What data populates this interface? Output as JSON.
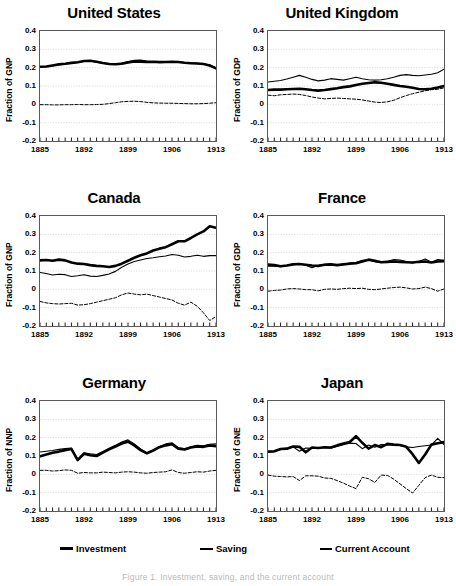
{
  "figure": {
    "caption": "Figure 1. Investment, saving, and the current account",
    "x_start": 1885,
    "x_end": 1913,
    "ylim": [
      -0.2,
      0.4
    ],
    "yticks": [
      "0.4",
      "0.3",
      "0.2",
      "0.1",
      "0",
      "-0.1",
      "-0.2"
    ],
    "xticklabels": [
      "1885",
      "1892",
      "1899",
      "1906",
      "1913"
    ],
    "xtickyears": [
      1885,
      1892,
      1899,
      1906,
      1913
    ]
  },
  "legend": {
    "items": [
      {
        "label": "Investment",
        "style": "thick-solid",
        "color": "#000000"
      },
      {
        "label": "Saving",
        "style": "thin-solid",
        "color": "#000000"
      },
      {
        "label": "Current Account",
        "style": "dashed",
        "color": "#000000"
      }
    ]
  },
  "chart_data": [
    {
      "type": "line",
      "title": "United States",
      "xlabel": "",
      "ylabel": "Fraction of GNP",
      "x": [
        1885,
        1886,
        1887,
        1888,
        1889,
        1890,
        1891,
        1892,
        1893,
        1894,
        1895,
        1896,
        1897,
        1898,
        1899,
        1900,
        1901,
        1902,
        1903,
        1904,
        1905,
        1906,
        1907,
        1908,
        1909,
        1910,
        1911,
        1912,
        1913
      ],
      "ylim": [
        -0.2,
        0.4
      ],
      "grid": true,
      "series": [
        {
          "name": "Investment",
          "values": [
            0.205,
            0.206,
            0.212,
            0.218,
            0.221,
            0.226,
            0.23,
            0.236,
            0.238,
            0.232,
            0.225,
            0.22,
            0.219,
            0.221,
            0.228,
            0.234,
            0.233,
            0.231,
            0.232,
            0.23,
            0.231,
            0.232,
            0.231,
            0.227,
            0.224,
            0.223,
            0.22,
            0.212,
            0.196
          ]
        },
        {
          "name": "Saving",
          "values": [
            0.204,
            0.205,
            0.21,
            0.216,
            0.22,
            0.224,
            0.229,
            0.234,
            0.236,
            0.23,
            0.224,
            0.219,
            0.22,
            0.225,
            0.234,
            0.24,
            0.241,
            0.236,
            0.232,
            0.23,
            0.23,
            0.231,
            0.231,
            0.228,
            0.226,
            0.224,
            0.221,
            0.214,
            0.199
          ]
        },
        {
          "name": "Current Account",
          "values": [
            -0.002,
            -0.002,
            -0.003,
            -0.003,
            -0.002,
            -0.002,
            -0.001,
            -0.002,
            -0.002,
            -0.001,
            0.0,
            0.004,
            0.009,
            0.014,
            0.016,
            0.017,
            0.015,
            0.011,
            0.008,
            0.007,
            0.006,
            0.006,
            0.005,
            0.004,
            0.003,
            0.003,
            0.004,
            0.006,
            0.009
          ]
        }
      ]
    },
    {
      "type": "line",
      "title": "United Kingdom",
      "xlabel": "",
      "ylabel": "Fraction of GDP",
      "x": [
        1885,
        1886,
        1887,
        1888,
        1889,
        1890,
        1891,
        1892,
        1893,
        1894,
        1895,
        1896,
        1897,
        1898,
        1899,
        1900,
        1901,
        1902,
        1903,
        1904,
        1905,
        1906,
        1907,
        1908,
        1909,
        1910,
        1911,
        1912,
        1913
      ],
      "ylim": [
        -0.2,
        0.4
      ],
      "grid": true,
      "series": [
        {
          "name": "Investment",
          "values": [
            0.078,
            0.08,
            0.08,
            0.082,
            0.084,
            0.085,
            0.082,
            0.078,
            0.075,
            0.078,
            0.083,
            0.088,
            0.094,
            0.098,
            0.105,
            0.112,
            0.116,
            0.12,
            0.118,
            0.112,
            0.106,
            0.1,
            0.096,
            0.09,
            0.084,
            0.082,
            0.085,
            0.092,
            0.1
          ]
        },
        {
          "name": "Saving",
          "values": [
            0.122,
            0.126,
            0.13,
            0.138,
            0.148,
            0.158,
            0.148,
            0.136,
            0.128,
            0.132,
            0.14,
            0.136,
            0.132,
            0.14,
            0.148,
            0.14,
            0.134,
            0.132,
            0.134,
            0.14,
            0.148,
            0.158,
            0.162,
            0.158,
            0.156,
            0.16,
            0.164,
            0.172,
            0.192
          ]
        },
        {
          "name": "Current Account",
          "values": [
            0.05,
            0.047,
            0.052,
            0.054,
            0.056,
            0.054,
            0.048,
            0.04,
            0.034,
            0.03,
            0.032,
            0.034,
            0.032,
            0.03,
            0.028,
            0.024,
            0.018,
            0.012,
            0.01,
            0.014,
            0.022,
            0.036,
            0.048,
            0.058,
            0.066,
            0.074,
            0.08,
            0.082,
            0.09
          ]
        }
      ]
    },
    {
      "type": "line",
      "title": "Canada",
      "xlabel": "",
      "ylabel": "Fraction of GNP",
      "x": [
        1885,
        1886,
        1887,
        1888,
        1889,
        1890,
        1891,
        1892,
        1893,
        1894,
        1895,
        1896,
        1897,
        1898,
        1899,
        1900,
        1901,
        1902,
        1903,
        1904,
        1905,
        1906,
        1907,
        1908,
        1909,
        1910,
        1911,
        1912,
        1913
      ],
      "ylim": [
        -0.2,
        0.4
      ],
      "grid": true,
      "series": [
        {
          "name": "Investment",
          "values": [
            0.158,
            0.16,
            0.156,
            0.162,
            0.158,
            0.146,
            0.14,
            0.138,
            0.132,
            0.128,
            0.126,
            0.122,
            0.128,
            0.14,
            0.156,
            0.172,
            0.186,
            0.196,
            0.212,
            0.222,
            0.23,
            0.246,
            0.262,
            0.262,
            0.28,
            0.3,
            0.316,
            0.344,
            0.336
          ]
        },
        {
          "name": "Saving",
          "values": [
            0.092,
            0.086,
            0.078,
            0.082,
            0.08,
            0.07,
            0.074,
            0.08,
            0.072,
            0.07,
            0.076,
            0.084,
            0.098,
            0.12,
            0.138,
            0.152,
            0.16,
            0.168,
            0.172,
            0.178,
            0.182,
            0.19,
            0.186,
            0.176,
            0.18,
            0.186,
            0.18,
            0.184,
            0.184
          ]
        },
        {
          "name": "Current Account",
          "values": [
            -0.066,
            -0.074,
            -0.078,
            -0.08,
            -0.078,
            -0.076,
            -0.086,
            -0.084,
            -0.078,
            -0.07,
            -0.062,
            -0.054,
            -0.046,
            -0.03,
            -0.02,
            -0.026,
            -0.03,
            -0.026,
            -0.034,
            -0.042,
            -0.05,
            -0.058,
            -0.076,
            -0.086,
            -0.07,
            -0.092,
            -0.128,
            -0.17,
            -0.148
          ]
        }
      ]
    },
    {
      "type": "line",
      "title": "France",
      "xlabel": "",
      "ylabel": "Fraction of GDP",
      "x": [
        1885,
        1886,
        1887,
        1888,
        1889,
        1890,
        1891,
        1892,
        1893,
        1894,
        1895,
        1896,
        1897,
        1898,
        1899,
        1900,
        1901,
        1902,
        1903,
        1904,
        1905,
        1906,
        1907,
        1908,
        1909,
        1910,
        1911,
        1912,
        1913
      ],
      "ylim": [
        -0.2,
        0.4
      ],
      "grid": true,
      "series": [
        {
          "name": "Investment",
          "values": [
            0.135,
            0.132,
            0.126,
            0.13,
            0.136,
            0.138,
            0.134,
            0.13,
            0.128,
            0.134,
            0.136,
            0.132,
            0.136,
            0.14,
            0.142,
            0.152,
            0.162,
            0.156,
            0.148,
            0.15,
            0.152,
            0.15,
            0.148,
            0.146,
            0.15,
            0.152,
            0.146,
            0.152,
            0.154
          ]
        },
        {
          "name": "Saving",
          "values": [
            0.126,
            0.128,
            0.124,
            0.13,
            0.138,
            0.14,
            0.132,
            0.118,
            0.13,
            0.136,
            0.138,
            0.13,
            0.138,
            0.144,
            0.146,
            0.158,
            0.16,
            0.15,
            0.146,
            0.152,
            0.162,
            0.16,
            0.152,
            0.144,
            0.152,
            0.166,
            0.148,
            0.162,
            0.158
          ]
        },
        {
          "name": "Current Account",
          "values": [
            -0.01,
            -0.006,
            -0.004,
            0.002,
            0.004,
            0.002,
            -0.002,
            -0.002,
            -0.008,
            0.0,
            0.002,
            0.0,
            0.004,
            0.006,
            0.004,
            0.006,
            0.0,
            -0.002,
            0.002,
            0.006,
            0.01,
            0.012,
            0.008,
            0.002,
            0.004,
            0.012,
            0.004,
            -0.01,
            0.002
          ]
        }
      ]
    },
    {
      "type": "line",
      "title": "Germany",
      "xlabel": "",
      "ylabel": "Fraction of NNP",
      "x": [
        1885,
        1886,
        1887,
        1888,
        1889,
        1890,
        1891,
        1892,
        1893,
        1894,
        1895,
        1896,
        1897,
        1898,
        1899,
        1900,
        1901,
        1902,
        1903,
        1904,
        1905,
        1906,
        1907,
        1908,
        1909,
        1910,
        1911,
        1912,
        1913
      ],
      "ylim": [
        -0.2,
        0.4
      ],
      "grid": true,
      "series": [
        {
          "name": "Investment",
          "values": [
            0.098,
            0.108,
            0.118,
            0.124,
            0.132,
            0.138,
            0.078,
            0.112,
            0.104,
            0.1,
            0.118,
            0.136,
            0.152,
            0.168,
            0.178,
            0.158,
            0.132,
            0.114,
            0.13,
            0.148,
            0.158,
            0.164,
            0.14,
            0.136,
            0.146,
            0.152,
            0.15,
            0.158,
            0.154
          ]
        },
        {
          "name": "Saving",
          "values": [
            0.122,
            0.126,
            0.13,
            0.136,
            0.14,
            0.144,
            0.082,
            0.118,
            0.112,
            0.108,
            0.124,
            0.142,
            0.158,
            0.176,
            0.188,
            0.166,
            0.138,
            0.118,
            0.132,
            0.152,
            0.166,
            0.172,
            0.146,
            0.14,
            0.15,
            0.158,
            0.156,
            0.164,
            0.166
          ]
        },
        {
          "name": "Current Account",
          "values": [
            0.022,
            0.022,
            0.018,
            0.02,
            0.024,
            0.022,
            0.006,
            0.01,
            0.008,
            0.008,
            0.012,
            0.01,
            0.008,
            0.012,
            0.014,
            0.012,
            0.008,
            0.006,
            0.01,
            0.012,
            0.014,
            0.024,
            0.01,
            0.006,
            0.01,
            0.014,
            0.012,
            0.018,
            0.022
          ]
        }
      ]
    },
    {
      "type": "line",
      "title": "Japan",
      "xlabel": "",
      "ylabel": "Fraction of GNE",
      "x": [
        1885,
        1886,
        1887,
        1888,
        1889,
        1890,
        1891,
        1892,
        1893,
        1894,
        1895,
        1896,
        1897,
        1898,
        1899,
        1900,
        1901,
        1902,
        1903,
        1904,
        1905,
        1906,
        1907,
        1908,
        1909,
        1910,
        1911,
        1912,
        1913
      ],
      "ylim": [
        -0.2,
        0.4
      ],
      "grid": true,
      "series": [
        {
          "name": "Investment",
          "values": [
            0.124,
            0.126,
            0.138,
            0.14,
            0.152,
            0.15,
            0.12,
            0.146,
            0.144,
            0.148,
            0.146,
            0.158,
            0.168,
            0.176,
            0.208,
            0.172,
            0.14,
            0.16,
            0.148,
            0.166,
            0.162,
            0.16,
            0.15,
            0.11,
            0.062,
            0.108,
            0.162,
            0.17,
            0.176,
            0.18
          ]
        },
        {
          "name": "Saving",
          "values": [
            0.122,
            0.124,
            0.136,
            0.138,
            0.15,
            0.126,
            0.144,
            0.142,
            0.142,
            0.146,
            0.142,
            0.152,
            0.162,
            0.17,
            0.168,
            0.14,
            0.16,
            0.148,
            0.162,
            0.16,
            0.162,
            0.158,
            0.15,
            0.146,
            0.152,
            0.156,
            0.16,
            0.196,
            0.162
          ]
        },
        {
          "name": "Current Account",
          "values": [
            -0.004,
            -0.01,
            -0.012,
            -0.014,
            -0.012,
            -0.034,
            -0.008,
            -0.008,
            -0.01,
            -0.02,
            -0.022,
            -0.034,
            -0.048,
            -0.064,
            -0.078,
            -0.016,
            -0.024,
            -0.044,
            -0.004,
            -0.006,
            -0.026,
            -0.052,
            -0.078,
            -0.102,
            -0.06,
            -0.018,
            -0.004,
            -0.016,
            -0.018,
            -0.018
          ]
        }
      ]
    }
  ]
}
